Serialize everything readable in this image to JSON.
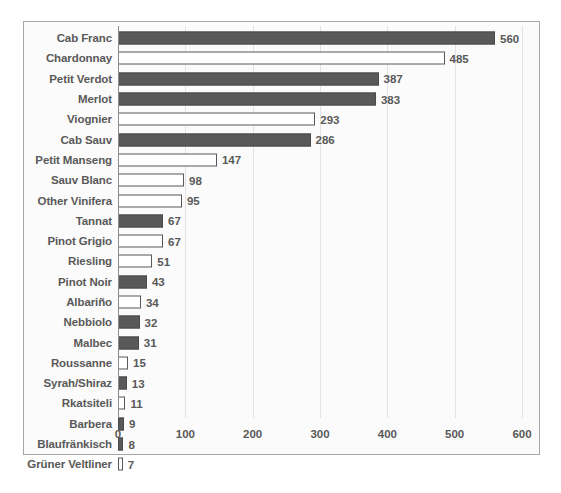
{
  "chart_data": {
    "type": "bar",
    "orientation": "horizontal",
    "title": "",
    "xlabel": "",
    "ylabel": "",
    "xlim": [
      0,
      600
    ],
    "xticks": [
      "0",
      "100",
      "200",
      "300",
      "400",
      "500",
      "600"
    ],
    "grid": true,
    "legend": "none",
    "colors": {
      "red_variety_fill": "#595959",
      "white_variety_fill": "#ffffff",
      "bar_outline": "#575757",
      "text": "#595959",
      "frame_border": "#a6a6a6",
      "gridline": "#e3e3e3",
      "axis_line": "#8c8c8c",
      "plot_background": "#f7f7f7"
    },
    "categories": [
      "Cab Franc",
      "Chardonnay",
      "Petit Verdot",
      "Merlot",
      "Viognier",
      "Cab Sauv",
      "Petit Manseng",
      "Sauv Blanc",
      "Other Vinifera",
      "Tannat",
      "Pinot Grigio",
      "Riesling",
      "Pinot Noir",
      "Albariño",
      "Nebbiolo",
      "Malbec",
      "Roussanne",
      "Syrah/Shiraz",
      "Rkatsiteli",
      "Barbera",
      "Blaufränkisch",
      "Grüner Veltliner"
    ],
    "values": [
      560,
      485,
      387,
      383,
      293,
      286,
      147,
      98,
      95,
      67,
      67,
      51,
      43,
      34,
      32,
      31,
      15,
      13,
      11,
      9,
      8,
      7
    ],
    "bars": [
      {
        "label": "Cab Franc",
        "value": 560,
        "value_text": "560",
        "style": "dark"
      },
      {
        "label": "Chardonnay",
        "value": 485,
        "value_text": "485",
        "style": "light"
      },
      {
        "label": "Petit Verdot",
        "value": 387,
        "value_text": "387",
        "style": "dark"
      },
      {
        "label": "Merlot",
        "value": 383,
        "value_text": "383",
        "style": "dark"
      },
      {
        "label": "Viognier",
        "value": 293,
        "value_text": "293",
        "style": "light"
      },
      {
        "label": "Cab Sauv",
        "value": 286,
        "value_text": "286",
        "style": "dark"
      },
      {
        "label": "Petit Manseng",
        "value": 147,
        "value_text": "147",
        "style": "light"
      },
      {
        "label": "Sauv Blanc",
        "value": 98,
        "value_text": "98",
        "style": "light"
      },
      {
        "label": "Other Vinifera",
        "value": 95,
        "value_text": "95",
        "style": "light"
      },
      {
        "label": "Tannat",
        "value": 67,
        "value_text": "67",
        "style": "dark"
      },
      {
        "label": "Pinot Grigio",
        "value": 67,
        "value_text": "67",
        "style": "light"
      },
      {
        "label": "Riesling",
        "value": 51,
        "value_text": "51",
        "style": "light"
      },
      {
        "label": "Pinot Noir",
        "value": 43,
        "value_text": "43",
        "style": "dark"
      },
      {
        "label": "Albariño",
        "value": 34,
        "value_text": "34",
        "style": "light"
      },
      {
        "label": "Nebbiolo",
        "value": 32,
        "value_text": "32",
        "style": "dark"
      },
      {
        "label": "Malbec",
        "value": 31,
        "value_text": "31",
        "style": "dark"
      },
      {
        "label": "Roussanne",
        "value": 15,
        "value_text": "15",
        "style": "light"
      },
      {
        "label": "Syrah/Shiraz",
        "value": 13,
        "value_text": "13",
        "style": "dark"
      },
      {
        "label": "Rkatsiteli",
        "value": 11,
        "value_text": "11",
        "style": "light"
      },
      {
        "label": "Barbera",
        "value": 9,
        "value_text": "9",
        "style": "dark"
      },
      {
        "label": "Blaufränkisch",
        "value": 8,
        "value_text": "8",
        "style": "dark"
      },
      {
        "label": "Grüner Veltliner",
        "value": 7,
        "value_text": "7",
        "style": "light"
      }
    ]
  },
  "background_text": [
    "",
    "",
    "",
    "",
    "",
    "",
    "",
    "",
    "",
    "",
    "",
    "",
    "",
    "",
    "",
    ""
  ]
}
